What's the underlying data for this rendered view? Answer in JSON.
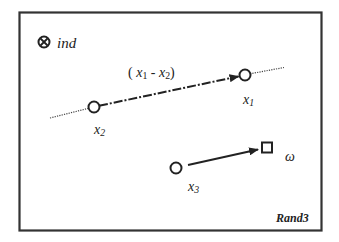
{
  "diagram": {
    "title": "Rand3",
    "legend": {
      "symbol": "circled-times",
      "label": "ind"
    },
    "nodes": [
      {
        "id": "x1",
        "label_base": "x",
        "label_sub": "1",
        "shape": "circle"
      },
      {
        "id": "x2",
        "label_base": "x",
        "label_sub": "2",
        "shape": "circle"
      },
      {
        "id": "x3",
        "label_base": "x",
        "label_sub": "3",
        "shape": "circle"
      },
      {
        "id": "omega",
        "label": "ω",
        "shape": "square"
      }
    ],
    "edges": [
      {
        "from": "x2",
        "to": "x1",
        "style": "dash-dot-arrow",
        "label": "(x1 - x2)"
      },
      {
        "from": "x3",
        "to": "omega",
        "style": "solid-arrow"
      }
    ],
    "difference_label": {
      "open": "(",
      "a_base": "x",
      "a_sub": "1",
      "minus": " - ",
      "b_base": "x",
      "b_sub": "2",
      "close": ")"
    },
    "labels": {
      "x1": {
        "base": "x",
        "sub": "1"
      },
      "x2": {
        "base": "x",
        "sub": "2"
      },
      "x3": {
        "base": "x",
        "sub": "3"
      },
      "omega": "ω",
      "ind": "ind",
      "rand": "Rand3"
    },
    "colors": {
      "stroke": "#222222",
      "frame": "#333333",
      "background": "#ffffff"
    }
  }
}
